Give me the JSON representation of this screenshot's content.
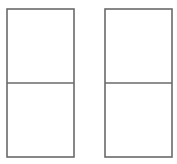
{
  "figure": {
    "title": "Two rectangles each divided into two equal squares",
    "background_color": "#ffffff",
    "line_color": "#6a6a6a",
    "line_width_px": 1.6,
    "canvas": {
      "width_px": 177,
      "height_px": 164
    },
    "shapes": [
      {
        "id": "left-rectangle",
        "label": "Left rectangle",
        "x": 7,
        "y": 9,
        "width": 67,
        "height": 148,
        "divider": {
          "id": "left-rectangle-divider",
          "orientation": "horizontal",
          "y": 83,
          "x1": 7,
          "x2": 74
        },
        "cells": [
          {
            "id": "left-rectangle-top-cell",
            "label": "Top square"
          },
          {
            "id": "left-rectangle-bottom-cell",
            "label": "Bottom square"
          }
        ]
      },
      {
        "id": "right-rectangle",
        "label": "Right rectangle",
        "x": 105,
        "y": 9,
        "width": 67,
        "height": 148,
        "divider": {
          "id": "right-rectangle-divider",
          "orientation": "horizontal",
          "y": 83,
          "x1": 105,
          "x2": 172
        },
        "cells": [
          {
            "id": "right-rectangle-top-cell",
            "label": "Top square"
          },
          {
            "id": "right-rectangle-bottom-cell",
            "label": "Bottom square"
          }
        ]
      }
    ]
  }
}
